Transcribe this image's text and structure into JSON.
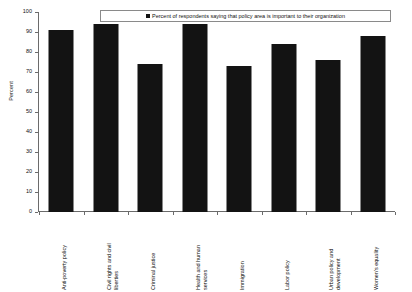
{
  "chart_data": {
    "type": "bar",
    "title": "",
    "xlabel": "",
    "ylabel": "Percent",
    "ylim": [
      0,
      100
    ],
    "ytick_step": 10,
    "yticks": [
      100,
      90,
      80,
      70,
      60,
      50,
      40,
      30,
      20,
      10,
      0
    ],
    "grid": false,
    "legend_position": "top-center",
    "series_name": "Percent of respondents saying that policy area is important to their organization",
    "bar_color": "#131313",
    "categories": [
      "Anti-poverty policy",
      "Civil rights and civil\nliberties",
      "Criminal justice",
      "Health and human\nservices",
      "Immigration",
      "Labor policy",
      "Urban policy and\ndevelopment",
      "Women's equality"
    ],
    "values": [
      91,
      94,
      74,
      94,
      73,
      84,
      76,
      88
    ]
  },
  "legend": {
    "label": "Percent of respondents saying that policy area is important to their organization"
  },
  "axis": {
    "y_title": "Percent"
  }
}
